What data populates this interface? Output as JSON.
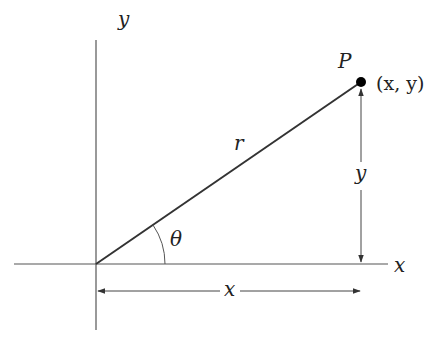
{
  "diagram": {
    "axes": {
      "x_label": "x",
      "y_label": "y"
    },
    "point": {
      "name": "P",
      "coords_label": "(x, y)"
    },
    "segments": {
      "radius_label": "r",
      "angle_label": "θ",
      "vertical_measure_label": "y",
      "horizontal_measure_label": "x"
    },
    "colors": {
      "line": "#333333",
      "axis": "#555555",
      "point": "#000000"
    }
  }
}
